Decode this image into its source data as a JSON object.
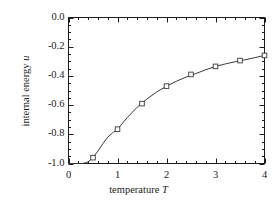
{
  "chart_data": {
    "type": "line",
    "title": "",
    "xlabel": "temperature T",
    "ylabel": "internal energy u",
    "xlim": [
      0,
      4
    ],
    "ylim": [
      -1.0,
      0.0
    ],
    "grid": false,
    "legend": null,
    "x_ticks": [
      "0",
      "1",
      "2",
      "3",
      "4"
    ],
    "x_tick_values": [
      0,
      1,
      2,
      3,
      4
    ],
    "x_minor_step": 0.2,
    "y_ticks": [
      "0.0",
      "-0.2",
      "-0.4",
      "-0.6",
      "-0.8",
      "-1.0"
    ],
    "y_tick_values": [
      0.0,
      -0.2,
      -0.4,
      -0.6,
      -0.8,
      -1.0
    ],
    "y_minor_step": 0.05,
    "series": [
      {
        "name": "internal energy",
        "marker": "open-square",
        "line_color": "#3a3a3a",
        "marker_edge_color": "#3a3a3a",
        "marker_face_color": "#ffffff",
        "x": [
          0.5,
          1.0,
          1.5,
          2.0,
          2.5,
          3.0,
          3.5,
          4.0
        ],
        "values": [
          -0.96,
          -0.765,
          -0.59,
          -0.47,
          -0.39,
          -0.335,
          -0.295,
          -0.26
        ]
      },
      {
        "name": "theory curve",
        "marker": "none",
        "line_color": "#3a3a3a",
        "x": [
          0.0,
          0.1,
          0.2,
          0.25,
          0.3,
          0.35,
          0.4,
          0.45,
          0.5,
          0.6,
          0.7,
          0.8,
          0.9,
          1.0,
          1.2,
          1.4,
          1.6,
          1.8,
          2.0,
          2.2,
          2.4,
          2.6,
          2.8,
          3.0,
          3.2,
          3.4,
          3.6,
          3.8,
          4.0
        ],
        "values": [
          -1.0,
          -1.0,
          -1.0,
          -1.0,
          -0.999,
          -0.995,
          -0.988,
          -0.976,
          -0.958,
          -0.915,
          -0.865,
          -0.82,
          -0.79,
          -0.765,
          -0.685,
          -0.615,
          -0.558,
          -0.51,
          -0.47,
          -0.437,
          -0.408,
          -0.384,
          -0.358,
          -0.335,
          -0.318,
          -0.303,
          -0.29,
          -0.275,
          -0.26
        ]
      }
    ]
  },
  "axis": {
    "x_title_text": "temperature ",
    "x_title_symbol": "T",
    "y_title_text": "internal energy ",
    "y_title_symbol": "u"
  }
}
